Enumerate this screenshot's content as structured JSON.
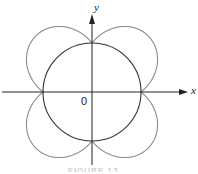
{
  "figure": {
    "x_label": "x",
    "y_label": "y",
    "origin_label": "0",
    "caption": "FIGURE 13"
  },
  "geometry": {
    "origin": [
      92,
      92
    ],
    "circle_radius": 49,
    "petal_factor": 0.62,
    "curve_color": "#8a8a8a",
    "circle_color": "#333333",
    "axis_color": "#222222"
  },
  "curves": [
    {
      "name": "circle",
      "equation": "r = a"
    },
    {
      "name": "four-lobed curve",
      "equation": "r = a(1 + k|sin 2θ|)"
    }
  ]
}
